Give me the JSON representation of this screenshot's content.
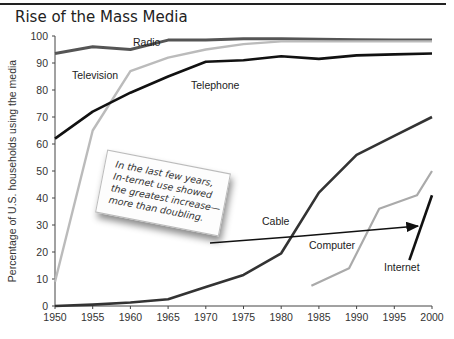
{
  "title": "Rise of the Mass Media",
  "annotation": "In the last few years, In-ternet use showed the greatest increase—more than doubling.",
  "chart_data": {
    "type": "line",
    "title": "Rise of the Mass Media",
    "xlabel": "",
    "ylabel": "Percentage of U.S. households using the media",
    "xlim": [
      1950,
      2000
    ],
    "ylim": [
      0,
      100
    ],
    "x_ticks": [
      "1950",
      "1955",
      "1960",
      "1965",
      "1970",
      "1975",
      "1980",
      "1985",
      "1990",
      "1995",
      "2000"
    ],
    "y_ticks": [
      "0",
      "10",
      "20",
      "30",
      "40",
      "50",
      "60",
      "70",
      "80",
      "90",
      "100"
    ],
    "grid": false,
    "legend": "inline labels",
    "series": [
      {
        "name": "Radio",
        "color": "#555555",
        "x": [
          1950,
          1955,
          1960,
          1965,
          1970,
          1975,
          1980,
          1985,
          1990,
          1995,
          2000
        ],
        "values": [
          93.5,
          96,
          95,
          98.5,
          98.5,
          99,
          99,
          98.8,
          98.6,
          98.5,
          98.5
        ]
      },
      {
        "name": "Television",
        "color": "#bbbbbb",
        "x": [
          1950,
          1955,
          1960,
          1965,
          1970,
          1975,
          1980,
          1985,
          1990,
          1995,
          2000
        ],
        "values": [
          9,
          65,
          87,
          92,
          95,
          97,
          98,
          98,
          98,
          98,
          98
        ]
      },
      {
        "name": "Telephone",
        "color": "#111111",
        "x": [
          1950,
          1955,
          1960,
          1965,
          1970,
          1975,
          1980,
          1985,
          1990,
          1995,
          2000
        ],
        "values": [
          62,
          72,
          79,
          85,
          90.5,
          91,
          92.5,
          91.5,
          92.8,
          93.2,
          93.5
        ]
      },
      {
        "name": "Cable",
        "color": "#333333",
        "x": [
          1950,
          1955,
          1960,
          1965,
          1970,
          1975,
          1980,
          1985,
          1990,
          1995,
          2000
        ],
        "values": [
          0,
          0.5,
          1.3,
          2.5,
          7,
          11.5,
          19.5,
          42,
          56,
          63,
          70
        ]
      },
      {
        "name": "Computer",
        "color": "#aaaaaa",
        "x": [
          1984,
          1989,
          1993,
          1998,
          2000
        ],
        "values": [
          7.5,
          14,
          36,
          41,
          50
        ]
      },
      {
        "name": "Internet",
        "color": "#111111",
        "x": [
          1997,
          2000
        ],
        "values": [
          17,
          41
        ]
      }
    ],
    "annotations": [
      {
        "text": "In the last few years, In-ternet use showed the greatest increase—more than doubling.",
        "arrow_to": [
          1997,
          26
        ]
      }
    ]
  }
}
